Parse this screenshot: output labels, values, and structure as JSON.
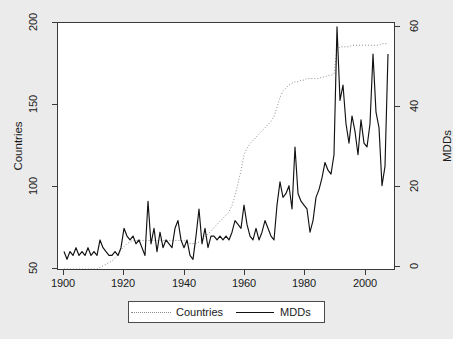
{
  "chart_data": {
    "type": "line",
    "title": "",
    "subtitle": "",
    "xlabel": "",
    "ylabel": "Countries",
    "y2label": "MDDs",
    "xlim": [
      1898,
      2010
    ],
    "ylim": [
      50,
      205
    ],
    "y2lim": [
      -1.5,
      62
    ],
    "grid": false,
    "legend_position": "bottom-center",
    "xticks": [
      "1900",
      "1920",
      "1940",
      "1960",
      "1980",
      "2000"
    ],
    "xtick_values": [
      1900,
      1920,
      1940,
      1960,
      1980,
      2000
    ],
    "yticks": [
      "50",
      "100",
      "150",
      "200"
    ],
    "ytick_values": [
      50,
      100,
      150,
      200
    ],
    "y2ticks": [
      "0",
      "20",
      "40",
      "60"
    ],
    "y2tick_values": [
      0,
      20,
      40,
      60
    ],
    "series": [
      {
        "name": "Countries",
        "axis": "left",
        "style": "dotted",
        "color": "#8a8a8a",
        "x": [
          1900,
          1901,
          1902,
          1903,
          1904,
          1905,
          1906,
          1907,
          1908,
          1909,
          1910,
          1911,
          1912,
          1913,
          1914,
          1915,
          1916,
          1917,
          1918,
          1919,
          1920,
          1921,
          1922,
          1923,
          1924,
          1925,
          1926,
          1927,
          1928,
          1929,
          1930,
          1931,
          1932,
          1933,
          1934,
          1935,
          1936,
          1937,
          1938,
          1939,
          1940,
          1941,
          1942,
          1943,
          1944,
          1945,
          1946,
          1947,
          1948,
          1949,
          1950,
          1951,
          1952,
          1953,
          1954,
          1955,
          1956,
          1957,
          1958,
          1959,
          1960,
          1961,
          1962,
          1963,
          1964,
          1965,
          1966,
          1967,
          1968,
          1969,
          1970,
          1971,
          1972,
          1973,
          1974,
          1975,
          1976,
          1977,
          1978,
          1979,
          1980,
          1981,
          1982,
          1983,
          1984,
          1985,
          1986,
          1987,
          1988,
          1989,
          1990,
          1991,
          1992,
          1993,
          1994,
          1995,
          1996,
          1997,
          1998,
          1999,
          2000,
          2001,
          2002,
          2003,
          2004,
          2005,
          2006,
          2007,
          2008
        ],
        "values": [
          50,
          50,
          50,
          50,
          50,
          50,
          50,
          50,
          50,
          50,
          50,
          50,
          51,
          52,
          53,
          54,
          55,
          57,
          59,
          62,
          64,
          66,
          67,
          68,
          68,
          68,
          68,
          68,
          68,
          68,
          68,
          68,
          68,
          68,
          68,
          68,
          68,
          68,
          68,
          68,
          68,
          67,
          66,
          66,
          66,
          67,
          68,
          70,
          72,
          74,
          76,
          78,
          80,
          82,
          84,
          86,
          90,
          96,
          104,
          112,
          122,
          126,
          129,
          131,
          133,
          135,
          137,
          139,
          141,
          143,
          146,
          152,
          158,
          162,
          164,
          166,
          167,
          168,
          168,
          169,
          169,
          170,
          170,
          170,
          170,
          170,
          171,
          171,
          172,
          172,
          173,
          188,
          190,
          190,
          190,
          190,
          191,
          191,
          191,
          191,
          191,
          191,
          191,
          191,
          191,
          191,
          192,
          192,
          192
        ]
      },
      {
        "name": "MDDs",
        "axis": "right",
        "style": "solid",
        "color": "#111111",
        "x": [
          1900,
          1901,
          1902,
          1903,
          1904,
          1905,
          1906,
          1907,
          1908,
          1909,
          1910,
          1911,
          1912,
          1913,
          1914,
          1915,
          1916,
          1917,
          1918,
          1919,
          1920,
          1921,
          1922,
          1923,
          1924,
          1925,
          1926,
          1927,
          1928,
          1929,
          1930,
          1931,
          1932,
          1933,
          1934,
          1935,
          1936,
          1937,
          1938,
          1939,
          1940,
          1941,
          1942,
          1943,
          1944,
          1945,
          1946,
          1947,
          1948,
          1949,
          1950,
          1951,
          1952,
          1953,
          1954,
          1955,
          1956,
          1957,
          1958,
          1959,
          1960,
          1961,
          1962,
          1963,
          1964,
          1965,
          1966,
          1967,
          1968,
          1969,
          1970,
          1971,
          1972,
          1973,
          1974,
          1975,
          1976,
          1977,
          1978,
          1979,
          1980,
          1981,
          1982,
          1983,
          1984,
          1985,
          1986,
          1987,
          1988,
          1989,
          1990,
          1991,
          1992,
          1993,
          1994,
          1995,
          1996,
          1997,
          1998,
          1999,
          2000,
          2001,
          2002,
          2003,
          2004,
          2005,
          2006,
          2007,
          2008
        ],
        "values": [
          3,
          1,
          3,
          2,
          4,
          2,
          3,
          2,
          4,
          2,
          3,
          2,
          6,
          4,
          3,
          2,
          2,
          3,
          2,
          4,
          9,
          7,
          6,
          7,
          5,
          6,
          4,
          2,
          16,
          5,
          9,
          3,
          8,
          4,
          6,
          5,
          4,
          9,
          11,
          6,
          4,
          6,
          2,
          1,
          7,
          14,
          5,
          9,
          4,
          7,
          7,
          6,
          7,
          6,
          7,
          6,
          8,
          11,
          10,
          9,
          15,
          10,
          7,
          6,
          9,
          6,
          8,
          11,
          9,
          7,
          6,
          15,
          21,
          17,
          18,
          20,
          14,
          30,
          18,
          16,
          15,
          14,
          8,
          11,
          17,
          19,
          22,
          26,
          24,
          23,
          28,
          61,
          42,
          46,
          36,
          31,
          38,
          34,
          28,
          37,
          31,
          30,
          36,
          54,
          39,
          35,
          20,
          25,
          54
        ]
      }
    ]
  },
  "axes": {
    "left_title": "Countries",
    "right_title": "MDDs"
  },
  "legend": {
    "entries": [
      {
        "label": "Countries",
        "style": "dotted"
      },
      {
        "label": "MDDs",
        "style": "solid"
      }
    ]
  }
}
